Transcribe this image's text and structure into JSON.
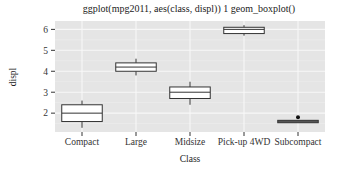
{
  "chart_data": {
    "type": "boxplot",
    "title": "ggplot(mpg2011, aes(class, displ)) 1 geom_boxplot()",
    "xlabel": "Class",
    "ylabel": "displ",
    "categories": [
      "Compact",
      "Large",
      "Midsize",
      "Pick-up 4WD",
      "Subcompact"
    ],
    "ylim": [
      1.1,
      6.4
    ],
    "yticks": [
      2,
      3,
      4,
      5,
      6
    ],
    "grid": true,
    "legend": "none",
    "colors": {
      "panel": "#e5e5e5",
      "grid_major": "#f7f7f7",
      "grid_minor": "#efefef",
      "box_fill": "#ffffff",
      "box_stroke": "#333333",
      "subcompact_box_fill": "#555555"
    },
    "boxes": [
      {
        "category": "Compact",
        "lower": 1.3,
        "q1": 1.6,
        "median": 2.0,
        "q3": 2.4,
        "upper": 2.6,
        "outliers": []
      },
      {
        "category": "Large",
        "lower": 3.8,
        "q1": 4.0,
        "median": 4.2,
        "q3": 4.4,
        "upper": 4.6,
        "outliers": []
      },
      {
        "category": "Midsize",
        "lower": 2.4,
        "q1": 2.7,
        "median": 3.0,
        "q3": 3.25,
        "upper": 3.5,
        "outliers": []
      },
      {
        "category": "Pick-up 4WD",
        "lower": 5.7,
        "q1": 5.8,
        "median": 6.0,
        "q3": 6.1,
        "upper": 6.2,
        "outliers": []
      },
      {
        "category": "Subcompact",
        "lower": 1.6,
        "q1": 1.58,
        "median": 1.6,
        "q3": 1.63,
        "upper": 1.6,
        "outliers": [
          1.8
        ]
      }
    ]
  }
}
